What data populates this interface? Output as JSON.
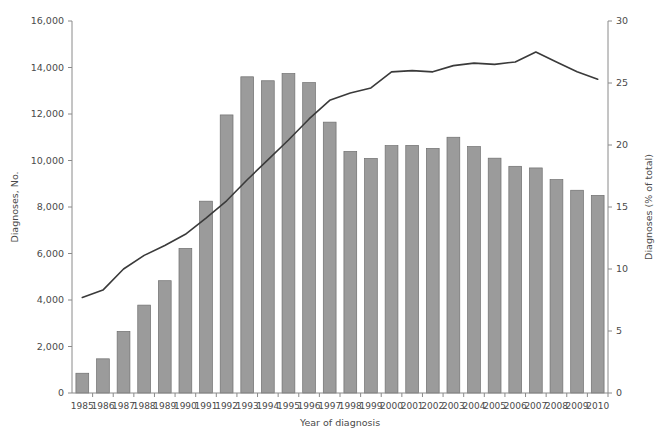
{
  "chart_data": {
    "type": "bar",
    "title": "",
    "subtitle": "",
    "xlabel": "Year of diagnosis",
    "ylabel": "Diagnoses, No.",
    "y2label": "Diagnoses (% of total)",
    "ylim": [
      0,
      16000
    ],
    "y2lim": [
      0,
      30
    ],
    "grid": false,
    "legend": "none",
    "categories": [
      "1985",
      "1986",
      "1987",
      "1988",
      "1989",
      "1990",
      "1991",
      "1992",
      "1993",
      "1994",
      "1995",
      "1996",
      "1997",
      "1998",
      "1999",
      "2000",
      "2001",
      "2002",
      "2003",
      "2004",
      "2005",
      "2006",
      "2007",
      "2008",
      "2009",
      "2010"
    ],
    "ytick_labels": [
      "0",
      "2,000",
      "4,000",
      "6,000",
      "8,000",
      "10,000",
      "12,000",
      "14,000",
      "16,000"
    ],
    "ytick_values": [
      0,
      2000,
      4000,
      6000,
      8000,
      10000,
      12000,
      14000,
      16000
    ],
    "y2tick_labels": [
      "0",
      "5",
      "10",
      "15",
      "20",
      "25",
      "30"
    ],
    "y2tick_values": [
      0,
      5,
      10,
      15,
      20,
      25,
      30
    ],
    "series": [
      {
        "name": "Diagnoses, No.",
        "type": "bar",
        "axis": "left",
        "color": "#9b9b9b",
        "values": [
          850,
          1470,
          2650,
          3780,
          4830,
          6220,
          8250,
          11960,
          13600,
          13430,
          13740,
          13350,
          11650,
          10390,
          10090,
          10640,
          10650,
          10520,
          11000,
          10600,
          10100,
          9750,
          9680,
          9180,
          8720,
          8500
        ]
      },
      {
        "name": "Diagnoses (% of total)",
        "type": "line",
        "axis": "right",
        "color": "#3a3a3a",
        "values": [
          7.7,
          8.3,
          10.0,
          11.1,
          11.9,
          12.8,
          14.1,
          15.5,
          17.2,
          18.8,
          20.4,
          22.1,
          23.6,
          24.2,
          24.6,
          25.9,
          26.0,
          25.9,
          26.4,
          26.6,
          26.5,
          26.7,
          27.5,
          26.7,
          25.9,
          25.3
        ]
      }
    ]
  }
}
